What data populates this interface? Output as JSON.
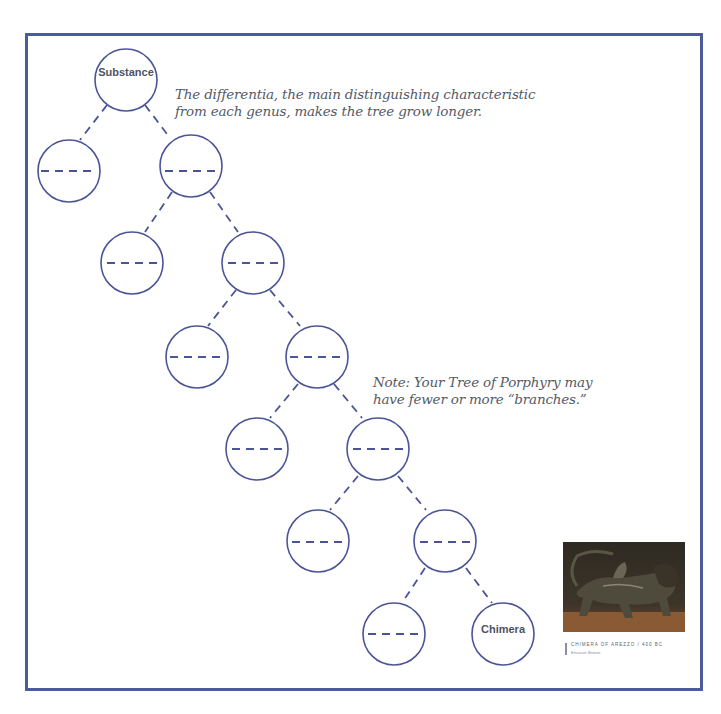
{
  "notes": {
    "differentia": {
      "line1": "The differentia, the main distinguishing characteristic",
      "line2": "from each genus, makes the tree grow longer."
    },
    "branches": {
      "line1": "Note: Your Tree of Porphyry may",
      "line2": "have fewer or more “branches.”"
    }
  },
  "tree": {
    "root_label": "Substance",
    "leaf_label": "Chimera",
    "blank_placeholder": "- - - -",
    "stroke_color": "#4b5596"
  },
  "artwork": {
    "title": "CHIMERA OF AREZZO / 400 BC",
    "subtitle": "Etruscan Bronze"
  },
  "colors": {
    "frame": "#4b5b9b",
    "text": "#555a66"
  }
}
